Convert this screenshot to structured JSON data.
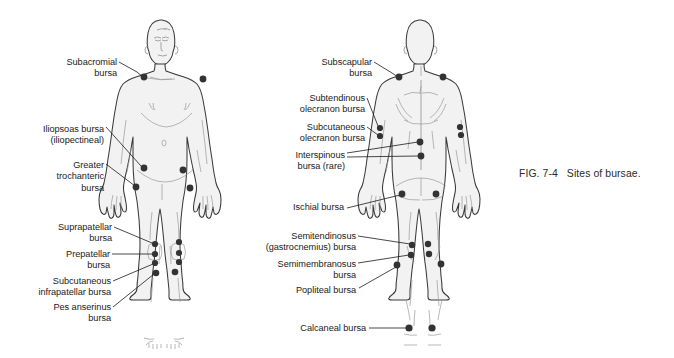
{
  "figure": {
    "caption": "FIG. 7-4   Sites of bursae.",
    "background_color": "#ffffff",
    "body_fill_color": "#f2f2f2",
    "body_outline_color": "#3a3a3a",
    "dot_color": "#333333",
    "leader_line_color": "#1b1b1b",
    "text_color": "#1b1b1b"
  },
  "anterior_view": {
    "view_name": "anterior",
    "labels": [
      {
        "id": "subacromial",
        "text": "Subacromial\nbursa",
        "align": "right",
        "x": 62,
        "y": 57
      },
      {
        "id": "iliopsoas",
        "text": "Iliopsoas bursa\n(iliopectineal)",
        "align": "right",
        "x": 36,
        "y": 124
      },
      {
        "id": "greater-trochanteric",
        "text": "Greater\ntrochanteric\nbursa",
        "align": "right",
        "x": 44,
        "y": 160
      },
      {
        "id": "suprapatellar",
        "text": "Suprapatellar\nbursa",
        "align": "right",
        "x": 60,
        "y": 222
      },
      {
        "id": "prepatellar",
        "text": "Prepatellar\nbursa",
        "align": "right",
        "x": 66,
        "y": 249
      },
      {
        "id": "subcutaneous-infrapatellar",
        "text": "Subcutaneous\ninfrapatellar bursa",
        "align": "right",
        "x": 40,
        "y": 275
      },
      {
        "id": "pes-anserinus",
        "text": "Pes anserinus\nbursa",
        "align": "right",
        "x": 58,
        "y": 302
      }
    ],
    "bursa_sites": [
      {
        "id": "subacromial-left-shoulder",
        "cx": 144,
        "cy": 77
      },
      {
        "id": "subacromial-right-shoulder",
        "cx": 203,
        "cy": 79
      },
      {
        "id": "iliopsoas-left",
        "cx": 144,
        "cy": 168
      },
      {
        "id": "iliopsoas-right",
        "cx": 183,
        "cy": 170
      },
      {
        "id": "greater-trochanteric-left",
        "cx": 136,
        "cy": 187
      },
      {
        "id": "greater-trochanteric-right",
        "cx": 190,
        "cy": 188
      },
      {
        "id": "suprapatellar-left",
        "cx": 155,
        "cy": 244
      },
      {
        "id": "suprapatellar-right",
        "cx": 179,
        "cy": 242
      },
      {
        "id": "prepatellar-left",
        "cx": 155,
        "cy": 254
      },
      {
        "id": "prepatellar-right",
        "cx": 179,
        "cy": 253
      },
      {
        "id": "subcutaneous-infrapatellar-left",
        "cx": 155,
        "cy": 263
      },
      {
        "id": "subcutaneous-infrapatellar-right",
        "cx": 179,
        "cy": 262
      },
      {
        "id": "pes-anserinus-left",
        "cx": 156,
        "cy": 273
      },
      {
        "id": "pes-anserinus-right",
        "cx": 175,
        "cy": 272
      }
    ]
  },
  "posterior_view": {
    "view_name": "posterior",
    "labels": [
      {
        "id": "subscapular",
        "text": "Subscapular\nbursa",
        "align": "right",
        "x": 315,
        "y": 57
      },
      {
        "id": "subtendinous-olecranon",
        "text": "Subtendinous\nolecranon bursa",
        "align": "right",
        "x": 285,
        "y": 93
      },
      {
        "id": "subcutaneous-olecranon",
        "text": "Subcutaneous\nolecranon bursa",
        "align": "right",
        "x": 285,
        "y": 122
      },
      {
        "id": "interspinous",
        "text": "Interspinous\nbursa (rare)",
        "align": "right",
        "x": 285,
        "y": 152
      },
      {
        "id": "ischial",
        "text": "Ischial bursa",
        "align": "right",
        "x": 281,
        "y": 202
      },
      {
        "id": "semitendinosus",
        "text": "Semitendinosus\n(gastrocnemius) bursa",
        "align": "right",
        "x": 265,
        "y": 231
      },
      {
        "id": "semimembranosus",
        "text": "Semimembranosus\nbursa",
        "align": "right",
        "x": 280,
        "y": 259
      },
      {
        "id": "popliteal",
        "text": "Popliteal bursa",
        "align": "right",
        "x": 284,
        "y": 285
      },
      {
        "id": "calcaneal",
        "text": "Calcaneal bursa",
        "align": "right",
        "x": 302,
        "y": 323
      }
    ],
    "bursa_sites": [
      {
        "id": "subscapular-left",
        "cx": 399,
        "cy": 77
      },
      {
        "id": "subscapular-right",
        "cx": 443,
        "cy": 77
      },
      {
        "id": "subtendinous-olecranon-left",
        "cx": 380,
        "cy": 128
      },
      {
        "id": "subtendinous-olecranon-right",
        "cx": 460,
        "cy": 127
      },
      {
        "id": "subcutaneous-olecranon-left",
        "cx": 380,
        "cy": 136
      },
      {
        "id": "subcutaneous-olecranon-right",
        "cx": 461,
        "cy": 135
      },
      {
        "id": "interspinous-upper",
        "cx": 420,
        "cy": 142
      },
      {
        "id": "interspinous-lower",
        "cx": 421,
        "cy": 156
      },
      {
        "id": "ischial-left",
        "cx": 402,
        "cy": 194
      },
      {
        "id": "ischial-right",
        "cx": 436,
        "cy": 194
      },
      {
        "id": "semitendinosus-left",
        "cx": 412,
        "cy": 245
      },
      {
        "id": "semitendinosus-right",
        "cx": 428,
        "cy": 244
      },
      {
        "id": "semimembranosus-left",
        "cx": 411,
        "cy": 255
      },
      {
        "id": "semimembranosus-right",
        "cx": 429,
        "cy": 254
      },
      {
        "id": "popliteal-left",
        "cx": 397,
        "cy": 265
      },
      {
        "id": "popliteal-right",
        "cx": 441,
        "cy": 264
      },
      {
        "id": "calcaneal-left",
        "cx": 409,
        "cy": 328
      },
      {
        "id": "calcaneal-right",
        "cx": 432,
        "cy": 328
      }
    ]
  }
}
